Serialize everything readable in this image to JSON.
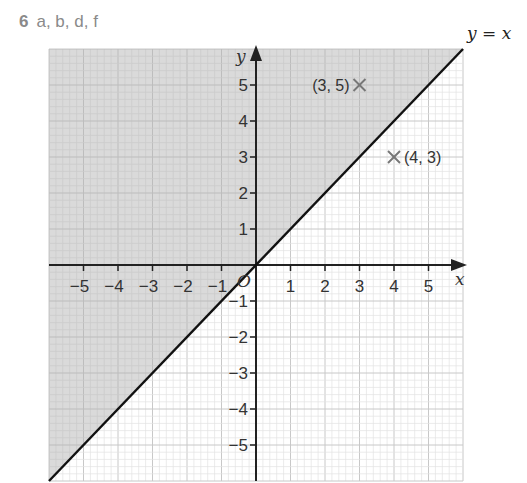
{
  "question": {
    "number": "6",
    "parts": "a, b, d, f"
  },
  "colors": {
    "shaded_region": "#d4d4d4",
    "grid_minor": "#e2e2e2",
    "grid_major": "#c8c8c8",
    "axis": "#222222",
    "line": "#111111",
    "point_marker": "#777777"
  },
  "chart_data": {
    "type": "line",
    "title": "",
    "xlabel": "x",
    "ylabel": "y",
    "xlim": [
      -6,
      6
    ],
    "ylim": [
      -6,
      6
    ],
    "grid": true,
    "x_ticks": [
      -5,
      -4,
      -3,
      -2,
      -1,
      1,
      2,
      3,
      4,
      5
    ],
    "y_ticks": [
      -5,
      -4,
      -3,
      -2,
      -1,
      1,
      2,
      3,
      4,
      5
    ],
    "origin_label": "O",
    "series": [
      {
        "name": "y = x",
        "label": "y = x",
        "x": [
          -6,
          6
        ],
        "y": [
          -6,
          6
        ]
      }
    ],
    "shaded_region": {
      "description": "region above the line y = x (y > x)",
      "inequality": "y > x"
    },
    "points": [
      {
        "label": "(3, 5)",
        "x": 3,
        "y": 5,
        "marker": "x"
      },
      {
        "label": "(4, 3)",
        "x": 4,
        "y": 3,
        "marker": "x"
      }
    ]
  }
}
